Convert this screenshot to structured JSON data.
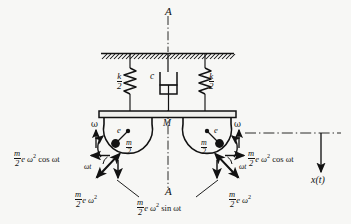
{
  "figure": {
    "type": "mechanical-vibration-diagram",
    "background_color": "#f7f7f5",
    "ink_color": "#121212",
    "centerline_label_top": "A",
    "centerline_label_bottom": "A",
    "support": {
      "kind": "fixed-ceiling-hatched"
    },
    "spring_left": {
      "label_num": "k",
      "label_den": "2"
    },
    "spring_right": {
      "label_num": "k",
      "label_den": "2"
    },
    "damper": {
      "label": "c"
    },
    "platform": {
      "label": "M"
    },
    "rotor_left": {
      "omega_label": "ω",
      "eccentricity_label": "e",
      "mass_num": "m",
      "mass_den": "2"
    },
    "rotor_right": {
      "omega_label": "ω",
      "eccentricity_label": "e",
      "mass_num": "m",
      "mass_den": "2"
    },
    "force_left": {
      "resultant_num": "m",
      "resultant_den": "2",
      "resultant_rest": "e ω",
      "resultant_exp": "2",
      "horizontal_num": "m",
      "horizontal_den": "2",
      "horizontal_rest": "e ω",
      "horizontal_exp": "2",
      "horizontal_trig": "cos ωt",
      "angle_label": "ωt"
    },
    "force_right": {
      "resultant_num": "m",
      "resultant_den": "2",
      "resultant_rest": "e ω",
      "resultant_exp": "2",
      "horizontal_num": "m",
      "horizontal_den": "2",
      "horizontal_rest": "e ω",
      "horizontal_exp": "2",
      "horizontal_trig": "cos ωt",
      "angle_label": "ωt"
    },
    "force_vertical": {
      "num": "m",
      "den": "2",
      "rest": "e ω",
      "exp": "2",
      "trig": "sin ωt"
    },
    "displacement": {
      "label": "x(t)"
    }
  }
}
